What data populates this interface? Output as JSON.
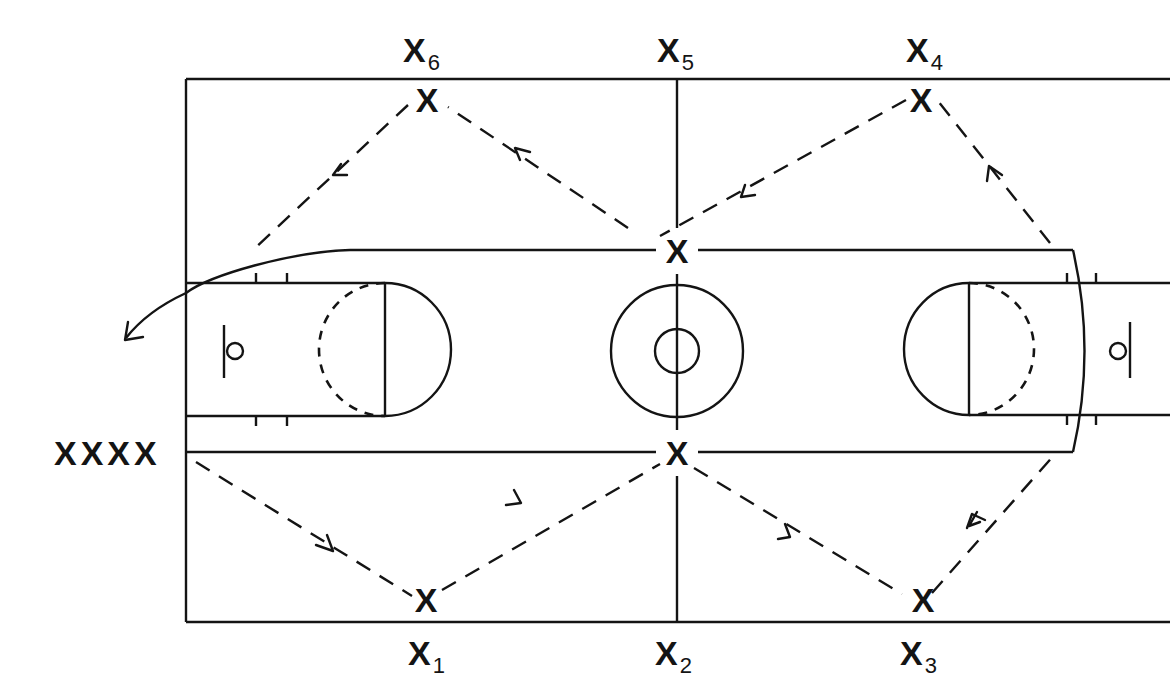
{
  "diagram": {
    "colors": {
      "ink": "#141414",
      "background": "#ffffff"
    },
    "waiting_line": {
      "label": "XXXX",
      "count": 4
    },
    "position_labels": [
      {
        "id": "x6",
        "base": "X",
        "sub": "6"
      },
      {
        "id": "x5",
        "base": "X",
        "sub": "5"
      },
      {
        "id": "x4",
        "base": "X",
        "sub": "4"
      },
      {
        "id": "x1",
        "base": "X",
        "sub": "1"
      },
      {
        "id": "x2",
        "base": "X",
        "sub": "2"
      },
      {
        "id": "x3",
        "base": "X",
        "sub": "3"
      }
    ],
    "players": [
      {
        "id": "p6",
        "glyph": "X"
      },
      {
        "id": "p4",
        "glyph": "X"
      },
      {
        "id": "p-center-top",
        "glyph": "X"
      },
      {
        "id": "p-center-bottom",
        "glyph": "X"
      },
      {
        "id": "p1",
        "glyph": "X"
      },
      {
        "id": "p3",
        "glyph": "X"
      }
    ],
    "passes": [
      "line -> X1",
      "X1 -> center-bottom",
      "center-bottom -> X3",
      "X3 -> right baseline",
      "right baseline -> X4",
      "X4 -> center-top",
      "center-top -> X6",
      "X6 -> left key",
      "curved path exits left"
    ]
  }
}
